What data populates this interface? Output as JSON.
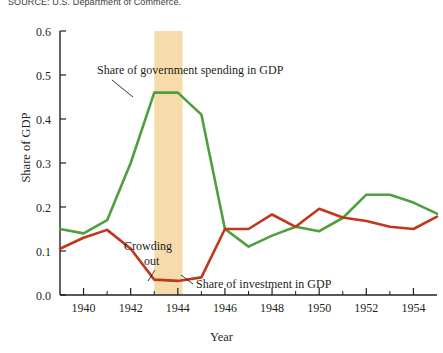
{
  "figure": {
    "source_note": "SOURCE: U.S. Department of Commerce.",
    "background": "#ffffff"
  },
  "annotations": {
    "gov_label": "Share of government spending in GDP",
    "inv_label": "Share of investment in GDP",
    "crowding_line1": "Crowding",
    "crowding_line2": "out"
  },
  "colors": {
    "government": "#4f9f3f",
    "investment": "#c0371c",
    "band": "#f5dcaa",
    "axis": "#231f20",
    "text": "#231f20"
  },
  "chart_data": {
    "type": "line",
    "title": "",
    "xlabel": "Year",
    "ylabel": "Share of GDP",
    "xlim": [
      1939,
      1955
    ],
    "ylim": [
      0.0,
      0.6
    ],
    "ytick_labels": [
      "0.0",
      "0.1",
      "0.2",
      "0.3",
      "0.4",
      "0.5",
      "0.6"
    ],
    "ytick_values": [
      0.0,
      0.1,
      0.2,
      0.3,
      0.4,
      0.5,
      0.6
    ],
    "xtick_labels": [
      "1940",
      "1942",
      "1944",
      "1946",
      "1948",
      "1950",
      "1952",
      "1954"
    ],
    "xtick_values": [
      1940,
      1942,
      1944,
      1946,
      1948,
      1950,
      1952,
      1954
    ],
    "xminor_values": [
      1941,
      1943,
      1945,
      1947,
      1949,
      1951,
      1953
    ],
    "grid": false,
    "legend": "inline-annotations",
    "x": [
      1939,
      1940,
      1941,
      1942,
      1943,
      1944,
      1945,
      1946,
      1947,
      1948,
      1949,
      1950,
      1951,
      1952,
      1953,
      1954,
      1955
    ],
    "series": [
      {
        "name": "Share of government spending in GDP",
        "color": "#4f9f3f",
        "values": [
          0.15,
          0.14,
          0.17,
          0.3,
          0.46,
          0.46,
          0.41,
          0.15,
          0.11,
          0.135,
          0.155,
          0.145,
          0.175,
          0.228,
          0.228,
          0.21,
          0.185
        ]
      },
      {
        "name": "Share of investment in GDP",
        "color": "#c0371c",
        "values": [
          0.105,
          0.13,
          0.148,
          0.105,
          0.035,
          0.032,
          0.04,
          0.15,
          0.15,
          0.183,
          0.155,
          0.196,
          0.176,
          0.168,
          0.155,
          0.15,
          0.178
        ]
      }
    ],
    "highlight_band": {
      "label": "Crowding out",
      "x_start": 1943.0,
      "x_end": 1944.2,
      "color": "#f5dcaa"
    }
  }
}
